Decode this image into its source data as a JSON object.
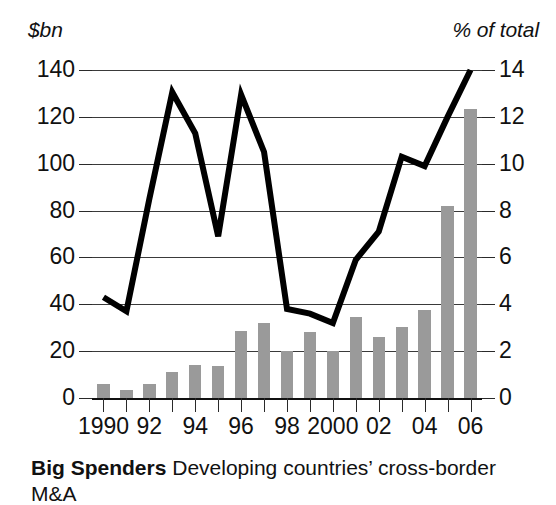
{
  "axes": {
    "left_unit": "$bn",
    "right_unit": "% of total",
    "left_ticks": [
      "0",
      "20",
      "40",
      "60",
      "80",
      "100",
      "120",
      "140"
    ],
    "right_ticks": [
      "0",
      "2",
      "4",
      "6",
      "8",
      "10",
      "12",
      "14"
    ],
    "x_ticks": [
      "1990",
      "",
      "92",
      "",
      "94",
      "",
      "96",
      "",
      "98",
      "",
      "2000",
      "",
      "02",
      "",
      "04",
      "",
      "06"
    ]
  },
  "caption": {
    "title": "Big Spenders",
    "text": "Developing countries’ cross-border M&A"
  },
  "colors": {
    "bar": "#9a9a9a",
    "line": "#000000",
    "grid": "#3a3a3a",
    "text": "#111111",
    "background": "#ffffff"
  },
  "chart_data": {
    "type": "bar",
    "title": "Big Spenders",
    "subtitle": "Developing countries’ cross-border M&A",
    "xlabel": "",
    "ylabel": "$bn",
    "y2label": "% of total",
    "ylim": [
      0,
      140
    ],
    "y2lim": [
      0,
      14
    ],
    "grid": true,
    "legend": "none",
    "categories": [
      "1990",
      "1991",
      "1992",
      "1993",
      "1994",
      "1995",
      "1996",
      "1997",
      "1998",
      "1999",
      "2000",
      "2001",
      "2002",
      "2003",
      "2004",
      "2005",
      "2006"
    ],
    "series": [
      {
        "name": "Cross-border M&A value",
        "type": "bar",
        "axis": "left",
        "unit": "$bn",
        "values": [
          6,
          3.5,
          6,
          11,
          14,
          13.5,
          28.5,
          32,
          20,
          28,
          20,
          34.5,
          26,
          30.5,
          37.5,
          82,
          123.5
        ]
      },
      {
        "name": "Share of total",
        "type": "line",
        "axis": "right",
        "unit": "% of total",
        "values": [
          4.3,
          3.7,
          8.5,
          13.05,
          11.3,
          6.9,
          12.95,
          10.5,
          3.8,
          3.6,
          3.2,
          5.9,
          7.1,
          10.3,
          9.9,
          12.0,
          14.0
        ]
      }
    ]
  }
}
